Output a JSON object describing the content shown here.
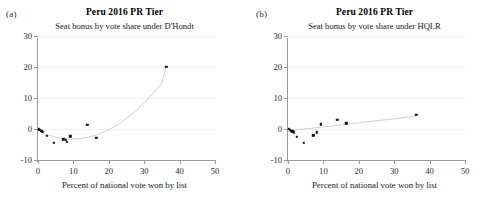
{
  "figure": {
    "axis_color": "#9a9a9a",
    "grid_color": "#f0f0f2",
    "marker_color": "#111111",
    "fit_color": "#c9c9cf"
  },
  "panels": [
    {
      "letter": "(a)",
      "title": "Peru 2016 PR Tier",
      "subtitle": "Seat bonus by vote share under D'Hondt",
      "xaxis_title": "Percent of national vote won by list"
    },
    {
      "letter": "(b)",
      "title": "Peru 2016 PR Tier",
      "subtitle": "Seat bonus by vote share under HQLR",
      "xaxis_title": "Percent of national vote won by list"
    }
  ],
  "chart_data": [
    {
      "type": "scatter",
      "panel": "(a)",
      "title": "Peru 2016 PR Tier",
      "subtitle": "Seat bonus by vote share under D'Hondt",
      "xlabel": "Percent of national vote won by list",
      "ylabel": "",
      "xlim": [
        0,
        50
      ],
      "ylim": [
        -10,
        30
      ],
      "xticks": [
        0,
        10,
        20,
        30,
        40,
        50
      ],
      "yticks": [
        -10,
        0,
        10,
        20,
        30
      ],
      "grid": "horizontal",
      "legend": "none",
      "points": [
        {
          "x": 0.2,
          "y": -0.1
        },
        {
          "x": 0.5,
          "y": -0.3
        },
        {
          "x": 0.8,
          "y": -0.5
        },
        {
          "x": 1.1,
          "y": -0.8
        },
        {
          "x": 1.4,
          "y": -1.0
        },
        {
          "x": 2.4,
          "y": -2.2
        },
        {
          "x": 4.4,
          "y": -4.4
        },
        {
          "x": 7.2,
          "y": -3.3
        },
        {
          "x": 7.9,
          "y": -3.4
        },
        {
          "x": 8.2,
          "y": -4.2
        },
        {
          "x": 9.1,
          "y": -2.4
        },
        {
          "x": 13.9,
          "y": 1.4
        },
        {
          "x": 16.5,
          "y": -2.8
        },
        {
          "x": 36.2,
          "y": 20.0
        }
      ],
      "fit": {
        "shape": "quadratic",
        "description": "U-shaped quadratic fit, minimum near x=12",
        "points": [
          {
            "x": 0.0,
            "y": -0.3
          },
          {
            "x": 2.5,
            "y": -1.8
          },
          {
            "x": 5.0,
            "y": -2.7
          },
          {
            "x": 7.5,
            "y": -3.2
          },
          {
            "x": 10.0,
            "y": -3.3
          },
          {
            "x": 12.5,
            "y": -3.0
          },
          {
            "x": 15.0,
            "y": -2.4
          },
          {
            "x": 17.5,
            "y": -1.5
          },
          {
            "x": 20.0,
            "y": -0.2
          },
          {
            "x": 22.5,
            "y": 1.4
          },
          {
            "x": 25.0,
            "y": 3.4
          },
          {
            "x": 27.5,
            "y": 5.7
          },
          {
            "x": 30.0,
            "y": 8.4
          },
          {
            "x": 32.5,
            "y": 11.5
          },
          {
            "x": 35.0,
            "y": 14.9
          },
          {
            "x": 36.2,
            "y": 20.0
          }
        ]
      }
    },
    {
      "type": "scatter",
      "panel": "(b)",
      "title": "Peru 2016 PR Tier",
      "subtitle": "Seat bonus by vote share under HQLR",
      "xlabel": "Percent of national vote won by list",
      "ylabel": "",
      "xlim": [
        0,
        50
      ],
      "ylim": [
        -10,
        30
      ],
      "xticks": [
        0,
        10,
        20,
        30,
        40,
        50
      ],
      "yticks": [
        -10,
        0,
        10,
        20,
        30
      ],
      "grid": "horizontal",
      "legend": "none",
      "points": [
        {
          "x": 0.2,
          "y": 0.1
        },
        {
          "x": 0.5,
          "y": -0.2
        },
        {
          "x": 0.9,
          "y": -0.5
        },
        {
          "x": 1.2,
          "y": -0.8
        },
        {
          "x": 1.6,
          "y": -1.1
        },
        {
          "x": 2.4,
          "y": -2.5
        },
        {
          "x": 4.4,
          "y": -4.5
        },
        {
          "x": 7.1,
          "y": -2.0
        },
        {
          "x": 8.2,
          "y": -1.1
        },
        {
          "x": 9.3,
          "y": 1.5
        },
        {
          "x": 13.9,
          "y": 3.0
        },
        {
          "x": 16.5,
          "y": 1.8
        },
        {
          "x": 36.2,
          "y": 4.5
        }
      ],
      "fit": {
        "shape": "linear",
        "description": "Gentle upward near-linear fit",
        "points": [
          {
            "x": 0.0,
            "y": -0.6
          },
          {
            "x": 10.0,
            "y": 0.7
          },
          {
            "x": 20.0,
            "y": 2.0
          },
          {
            "x": 30.0,
            "y": 3.3
          },
          {
            "x": 36.2,
            "y": 4.2
          }
        ]
      }
    }
  ]
}
